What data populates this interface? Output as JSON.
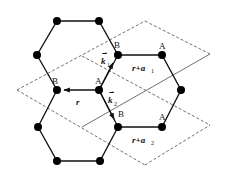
{
  "figure": {
    "colors": {
      "line": "#111111",
      "dashed": "#333333",
      "background": "#ffffff"
    },
    "labels": {
      "B_left": "B",
      "A_center": "A",
      "B_upper": "B",
      "A_upper": "A",
      "B_lower": "B",
      "A_lower": "A",
      "r": "r",
      "r_plus_a1": "r+a",
      "a1_sub": "1",
      "r_plus_a2": "r+a",
      "a2_sub": "2",
      "k1": "k",
      "k1_sub": "1",
      "k2": "k",
      "k2_sub": "2"
    },
    "vectors": [
      {
        "name": "r",
        "from": "A_center",
        "to": "B_left"
      },
      {
        "name": "k1",
        "from": "A_center",
        "to": "B_upper"
      },
      {
        "name": "k2",
        "from": "A_center",
        "to": "B_lower"
      }
    ],
    "cells": [
      "r",
      "r+a1",
      "r+a2"
    ]
  }
}
